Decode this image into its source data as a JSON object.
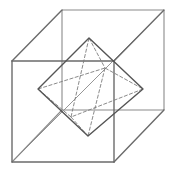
{
  "figure": {
    "title": "Octahedron inscribed in a cube",
    "colors": {
      "background": "#ffffff",
      "cube_edge": "#6b6b6b",
      "cube_back_edge": "#8a8a8a",
      "diagonal": "#8a8a8a",
      "octahedron_edge": "#555555",
      "octahedron_hidden": "#7d7d7d"
    },
    "cube": {
      "front_face": {
        "tl": [
          12,
          61
        ],
        "tr": [
          114,
          61
        ],
        "br": [
          114,
          162
        ],
        "bl": [
          12,
          162
        ]
      },
      "back_face": {
        "tl": [
          62,
          10
        ],
        "tr": [
          164,
          10
        ],
        "br": [
          164,
          110
        ],
        "bl": [
          62,
          110
        ]
      },
      "space_diagonal": {
        "from": [
          12,
          162
        ],
        "to": [
          164,
          10
        ]
      }
    },
    "octahedron": {
      "top": [
        89,
        38
      ],
      "bottom": [
        88,
        136
      ],
      "left": [
        38,
        89
      ],
      "right": [
        143,
        89
      ],
      "back": [
        105,
        68
      ],
      "front": [
        71,
        117
      ]
    }
  }
}
